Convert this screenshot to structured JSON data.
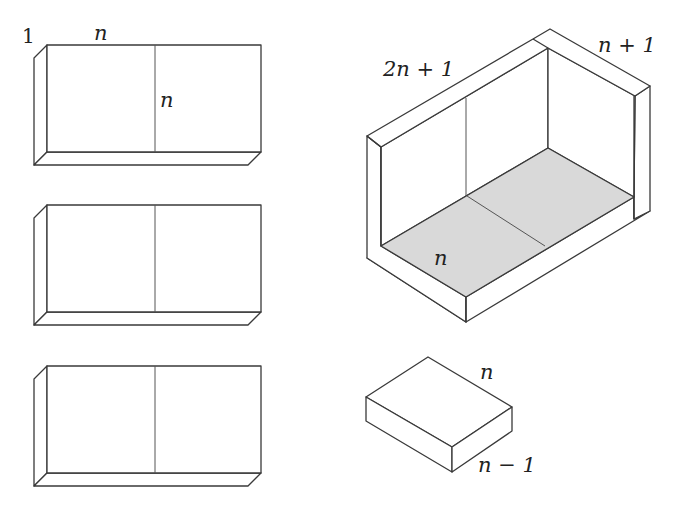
{
  "diagram": {
    "colors": {
      "stroke": "#3a3a3a",
      "floor_fill": "#d9d9d9",
      "background": "#ffffff"
    },
    "slabs": [
      {
        "id": "slab-1",
        "labels": {
          "thickness": "1",
          "width": "n",
          "height": "n"
        }
      },
      {
        "id": "slab-2"
      },
      {
        "id": "slab-3"
      }
    ],
    "box": {
      "labels": {
        "long_side": "2n + 1",
        "short_side": "n + 1",
        "floor": "n"
      }
    },
    "block": {
      "labels": {
        "top_side": "n",
        "height_side": "n − 1"
      }
    }
  }
}
